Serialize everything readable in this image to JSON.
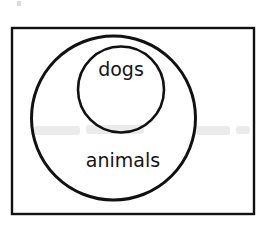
{
  "figure": {
    "background_color": "#ffffff",
    "stroke_color": "#111111",
    "text_color": "#141414"
  },
  "frame": {
    "name": "universal-set-rectangle",
    "x": 12,
    "y": 28,
    "width": 242,
    "height": 186,
    "stroke_width": 2.4
  },
  "sets": [
    {
      "id": "animals",
      "label": "animals",
      "shape": "circle",
      "cx": 113.5,
      "cy": 118,
      "r": 82,
      "stroke_width": 3.0,
      "label_x": 123,
      "label_y": 161,
      "label_size": 19
    },
    {
      "id": "dogs",
      "label": "dogs",
      "shape": "circle",
      "cx": 121,
      "cy": 89.5,
      "r": 43,
      "stroke_width": 2.6,
      "label_x": 121,
      "label_y": 70,
      "label_size": 19
    }
  ],
  "relation": {
    "type": "subset",
    "statement": "dogs ⊂ animals"
  },
  "artifacts": [
    {
      "name": "scan-ghost-left",
      "x": 34,
      "y": 126,
      "width": 46,
      "height": 9
    },
    {
      "name": "scan-ghost-center",
      "x": 86,
      "y": 125,
      "width": 58,
      "height": 9
    },
    {
      "name": "scan-ghost-right",
      "x": 196,
      "y": 126,
      "width": 34,
      "height": 9
    },
    {
      "name": "scan-ghost-far",
      "x": 236,
      "y": 126,
      "width": 14,
      "height": 8
    },
    {
      "name": "scan-speck-top",
      "x": 17,
      "y": 1,
      "width": 4,
      "height": 5
    }
  ]
}
